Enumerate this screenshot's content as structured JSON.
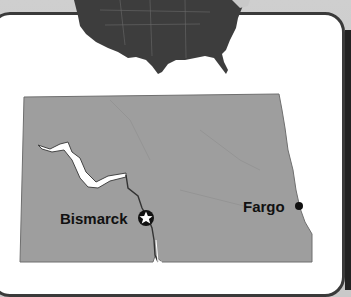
{
  "map": {
    "inset_map": "United States (contiguous) locator",
    "state": "North Dakota",
    "colors": {
      "state_fill": "#9e9e9e",
      "us_fill": "#3d3d3d",
      "frame_border": "#3a3a3a",
      "frame_bg": "#ffffff",
      "water": "#ffffff"
    },
    "cities": [
      {
        "name": "Bismarck",
        "marker": "star-in-circle",
        "capital": true
      },
      {
        "name": "Fargo",
        "marker": "dot",
        "capital": false
      }
    ],
    "features": [
      "Lake Sakakawea",
      "Missouri River"
    ]
  }
}
